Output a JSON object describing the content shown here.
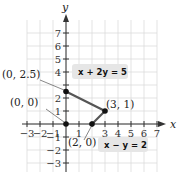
{
  "chart_data": {
    "type": "line",
    "title": "",
    "xlabel": "x",
    "ylabel": "y",
    "xlim": [
      -3,
      7
    ],
    "ylim": [
      -3,
      7
    ],
    "grid": true,
    "x_ticks": [
      "-3",
      "-2",
      "-1",
      "1",
      "3",
      "4",
      "5",
      "6",
      "7"
    ],
    "y_ticks": [
      "7",
      "6",
      "5",
      "4",
      "2",
      "1",
      "-1",
      "-2",
      "-3"
    ],
    "series": [
      {
        "name": "x + 2y = 5",
        "points": [
          [
            0,
            2.5
          ],
          [
            3,
            1
          ]
        ]
      },
      {
        "name": "x - y = 2",
        "points": [
          [
            2,
            0
          ],
          [
            3,
            1
          ]
        ]
      }
    ],
    "points": [
      {
        "label": "(0, 0)",
        "x": 0,
        "y": 0
      },
      {
        "label": "(0, 2.5)",
        "x": 0,
        "y": 2.5
      },
      {
        "label": "(3, 1)",
        "x": 3,
        "y": 1
      },
      {
        "label": "(2, 0)",
        "x": 2,
        "y": 0
      }
    ],
    "annotations": [
      {
        "text": "x + 2y = 5",
        "near": [
          3.5,
          4
        ]
      },
      {
        "text": "x - y = 2",
        "near": [
          4.5,
          -1.5
        ]
      }
    ]
  },
  "labels": {
    "x_axis": "x",
    "y_axis": "y",
    "pt_origin": "(0, 0)",
    "pt_y_int": "(0, 2.5)",
    "pt_vertex": "(3, 1)",
    "pt_x_int": "(2, 0)",
    "eq1": "x + 2y = 5",
    "eq2": "x − y = 2"
  },
  "colors": {
    "grid": "#dcdcdc",
    "axis": "#333333",
    "segment": "#555555",
    "point": "#111111",
    "label_box": "#e6e6e6"
  }
}
